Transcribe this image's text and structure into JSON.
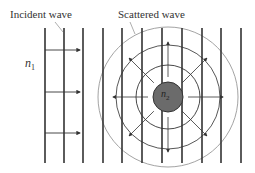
{
  "labels": {
    "incident": "Incident wave",
    "scattered": "Scattered wave",
    "n1": "n",
    "n1_sub": "1",
    "n2": "n",
    "n2_sub": "2"
  },
  "diagram": {
    "wavefront_x": [
      45,
      64,
      83,
      103,
      122,
      142,
      162,
      182,
      202,
      221,
      241
    ],
    "wavefront_y": [
      28,
      163
    ],
    "incident_arrows_y": [
      50,
      92,
      133
    ],
    "scatterer": {
      "cx": 168,
      "cy": 97,
      "r": 15,
      "fill": "#6b6b6b"
    },
    "rings": [
      {
        "r": 32,
        "color": "#333333"
      },
      {
        "r": 52,
        "color": "#444444"
      },
      {
        "r": 70,
        "color": "#999999"
      }
    ]
  }
}
